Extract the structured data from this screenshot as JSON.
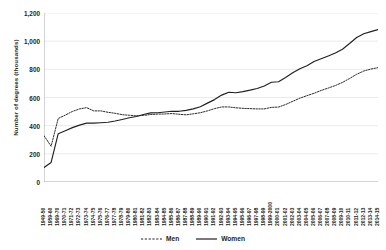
{
  "chart_data": {
    "type": "line",
    "title": "",
    "xlabel": "",
    "ylabel": "Number of degrees (thousands)",
    "ylim": [
      0,
      1200
    ],
    "yticks": [
      0,
      200,
      400,
      600,
      800,
      1000,
      1200
    ],
    "ytick_labels": [
      "0",
      "200",
      "400",
      "600",
      "800",
      "1,000",
      "1,200"
    ],
    "grid": "horizontal",
    "legend_position": "bottom-center",
    "categories": [
      "1949-50",
      "1959-60",
      "1969-70",
      "1970-71",
      "1971-72",
      "1972-73",
      "1973-74",
      "1974-75",
      "1975-76",
      "1976-77",
      "1977-78",
      "1978-79",
      "1979-80",
      "1980-81",
      "1981-82",
      "1982-83",
      "1983-84",
      "1984-85",
      "1985-86",
      "1986-87",
      "1987-88",
      "1988-89",
      "1989-90",
      "1990-91",
      "1991-92",
      "1992-93",
      "1993-94",
      "1994-95",
      "1995-96",
      "1996-97",
      "1997-98",
      "1998-99",
      "1999-2000",
      "2000-01",
      "2001-02",
      "2002-03",
      "2003-04",
      "2004-05",
      "2005-06",
      "2006-07",
      "2007-08",
      "2008-09",
      "2009-10",
      "2010-11",
      "2011-12",
      "2012-13",
      "2013-14",
      "2014-15"
    ],
    "series": [
      {
        "name": "Men",
        "style": "dashed",
        "color": "#231f20",
        "values": [
          329,
          254,
          451,
          475,
          501,
          519,
          528,
          505,
          505,
          495,
          488,
          478,
          474,
          470,
          473,
          479,
          482,
          483,
          486,
          481,
          477,
          484,
          492,
          505,
          521,
          533,
          533,
          527,
          523,
          521,
          519,
          519,
          530,
          532,
          550,
          573,
          595,
          613,
          630,
          650,
          667,
          685,
          707,
          735,
          765,
          788,
          802,
          812
        ]
      },
      {
        "name": "Women",
        "style": "solid",
        "color": "#231f20",
        "values": [
          103,
          139,
          343,
          364,
          386,
          404,
          418,
          418,
          421,
          424,
          433,
          444,
          456,
          465,
          479,
          491,
          492,
          497,
          502,
          502,
          509,
          519,
          534,
          560,
          585,
          617,
          637,
          634,
          642,
          652,
          664,
          682,
          708,
          712,
          742,
          775,
          804,
          826,
          855,
          875,
          895,
          916,
          943,
          983,
          1026,
          1053,
          1068,
          1082
        ]
      }
    ]
  },
  "legend": {
    "men_label": "Men",
    "women_label": "Women"
  }
}
